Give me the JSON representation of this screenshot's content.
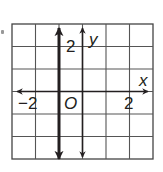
{
  "figure": {
    "type": "coordinate-plane",
    "grid": {
      "x_range": [
        -3,
        3
      ],
      "y_range": [
        -3,
        3
      ],
      "cell_units": 1,
      "line_color": "#555555",
      "border_color": "#333333"
    },
    "axes": {
      "x_label": "x",
      "y_label": "y",
      "origin_label": "O",
      "color": "#231f20"
    },
    "tick_labels": {
      "x_neg": "−2",
      "x_pos": "2",
      "y_pos": "2"
    },
    "graphed_line": {
      "equation": "x = -1",
      "orientation": "vertical",
      "x_value": -1,
      "arrows": "both ends",
      "color": "#231f20"
    }
  }
}
